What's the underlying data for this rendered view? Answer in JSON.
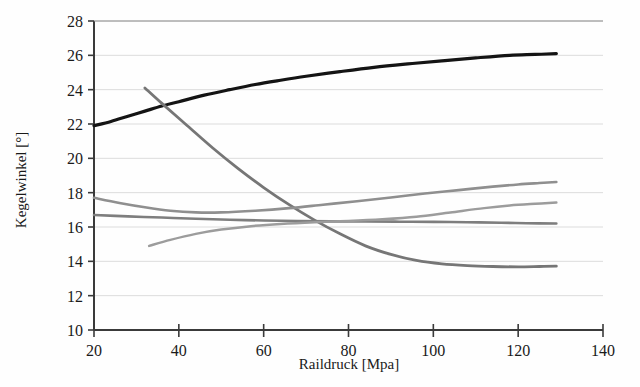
{
  "chart_data": {
    "type": "line",
    "title": "",
    "xlabel": "Raildruck [Mpa]",
    "ylabel": "Kegelwinkel [°]",
    "xlim": [
      20,
      140
    ],
    "ylim": [
      10,
      28
    ],
    "xticks": [
      20,
      40,
      60,
      80,
      100,
      120,
      140
    ],
    "yticks": [
      10,
      12,
      14,
      16,
      18,
      20,
      22,
      24,
      26,
      28
    ],
    "grid": true,
    "grid_axis": "y",
    "legend": "none",
    "colors": {
      "black_curve": "#141414",
      "gray_dark": "#6e6e6e",
      "gray_mid": "#8a8a8a",
      "gray_light": "#a8a8a8",
      "grid": "#dcdcdc",
      "axis": "#3a3a3a",
      "background": "#fefefe"
    },
    "series": [
      {
        "name": "curve-black-rising",
        "color": "#141414",
        "width": 3.2,
        "x": [
          20,
          24,
          28,
          32,
          36,
          40,
          46,
          52,
          58,
          64,
          70,
          78,
          86,
          94,
          102,
          110,
          118,
          124,
          129
        ],
        "values": [
          21.9,
          22.15,
          22.45,
          22.75,
          23.05,
          23.3,
          23.68,
          24.0,
          24.3,
          24.55,
          24.78,
          25.05,
          25.3,
          25.5,
          25.68,
          25.85,
          26.0,
          26.05,
          26.1
        ]
      },
      {
        "name": "curve-gray-steep-falling",
        "color": "#767676",
        "width": 2.8,
        "x": [
          32,
          36,
          42,
          48,
          54,
          60,
          66,
          72,
          78,
          84,
          90,
          96,
          102,
          108,
          114,
          120,
          125,
          129
        ],
        "values": [
          24.1,
          23.2,
          21.9,
          20.6,
          19.4,
          18.3,
          17.3,
          16.4,
          15.6,
          14.9,
          14.4,
          14.05,
          13.85,
          13.75,
          13.7,
          13.68,
          13.7,
          13.72
        ]
      },
      {
        "name": "curve-gray-rising-upper",
        "color": "#8f8f8f",
        "width": 2.6,
        "x": [
          20,
          26,
          32,
          38,
          44,
          50,
          58,
          66,
          74,
          82,
          90,
          98,
          106,
          114,
          120,
          125,
          129
        ],
        "values": [
          17.7,
          17.4,
          17.15,
          16.95,
          16.85,
          16.85,
          16.95,
          17.1,
          17.3,
          17.5,
          17.72,
          17.95,
          18.15,
          18.35,
          18.48,
          18.56,
          18.62
        ]
      },
      {
        "name": "curve-gray-flat",
        "color": "#7e7e7e",
        "width": 2.6,
        "x": [
          20,
          28,
          36,
          44,
          52,
          60,
          68,
          76,
          84,
          92,
          100,
          108,
          116,
          122,
          129
        ],
        "values": [
          16.7,
          16.62,
          16.55,
          16.48,
          16.42,
          16.38,
          16.35,
          16.33,
          16.32,
          16.31,
          16.3,
          16.28,
          16.25,
          16.22,
          16.2
        ]
      },
      {
        "name": "curve-gray-faint-rising",
        "color": "#9c9c9c",
        "width": 2.5,
        "x": [
          33,
          38,
          44,
          50,
          57,
          64,
          72,
          80,
          88,
          96,
          104,
          112,
          118,
          124,
          129
        ],
        "values": [
          14.9,
          15.25,
          15.6,
          15.85,
          16.05,
          16.18,
          16.28,
          16.35,
          16.45,
          16.6,
          16.85,
          17.1,
          17.25,
          17.35,
          17.42
        ]
      }
    ]
  },
  "axes": {
    "x_title": "Raildruck [Mpa]",
    "y_title": "Kegelwinkel [°]",
    "x_tick_labels": [
      "20",
      "40",
      "60",
      "80",
      "100",
      "120",
      "140"
    ],
    "y_tick_labels": [
      "10",
      "12",
      "14",
      "16",
      "18",
      "20",
      "22",
      "24",
      "26",
      "28"
    ]
  }
}
